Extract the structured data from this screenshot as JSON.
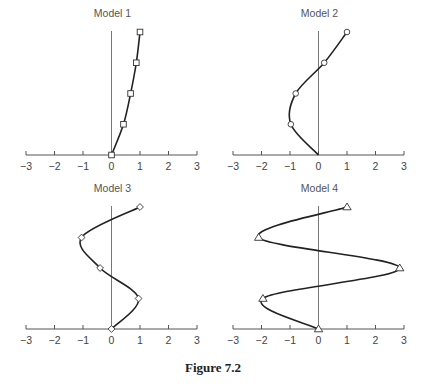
{
  "figure": {
    "caption": "Figure 7.2"
  },
  "chart_data": [
    {
      "type": "line",
      "title": "Model 1",
      "marker": "square",
      "xlim": [
        -3,
        3
      ],
      "xticks": [
        "-3",
        "-2",
        "-1",
        "0",
        "1",
        "2",
        "3"
      ],
      "levels": [
        0,
        1,
        2,
        3,
        4
      ],
      "points": [
        0,
        0.42,
        0.67,
        0.87,
        1.0
      ],
      "marked": [
        true,
        true,
        true,
        true,
        true
      ],
      "grid": false
    },
    {
      "type": "line",
      "title": "Model 2",
      "marker": "circle",
      "xlim": [
        -3,
        3
      ],
      "xticks": [
        "-3",
        "-2",
        "-1",
        "0",
        "1",
        "2",
        "3"
      ],
      "levels": [
        0,
        1,
        2,
        3,
        4
      ],
      "points": [
        0,
        -0.97,
        -0.8,
        0.2,
        1.0
      ],
      "marked": [
        false,
        true,
        true,
        true,
        true
      ],
      "grid": false
    },
    {
      "type": "line",
      "title": "Model 3",
      "marker": "diamond",
      "xlim": [
        -3,
        3
      ],
      "xticks": [
        "-3",
        "-2",
        "-1",
        "0",
        "1",
        "2",
        "3"
      ],
      "levels": [
        0,
        1,
        2,
        3,
        4
      ],
      "points": [
        0,
        0.95,
        -0.4,
        -1.05,
        1.0
      ],
      "marked": [
        true,
        true,
        true,
        true,
        true
      ],
      "grid": false
    },
    {
      "type": "line",
      "title": "Model 4",
      "marker": "triangle",
      "xlim": [
        -3,
        3
      ],
      "xticks": [
        "-3",
        "-2",
        "-1",
        "0",
        "1",
        "2",
        "3"
      ],
      "levels": [
        0,
        1,
        2,
        3,
        4
      ],
      "points": [
        0,
        -1.95,
        2.85,
        -2.1,
        1.0
      ],
      "marked": [
        true,
        true,
        true,
        true,
        true
      ],
      "grid": false
    }
  ]
}
